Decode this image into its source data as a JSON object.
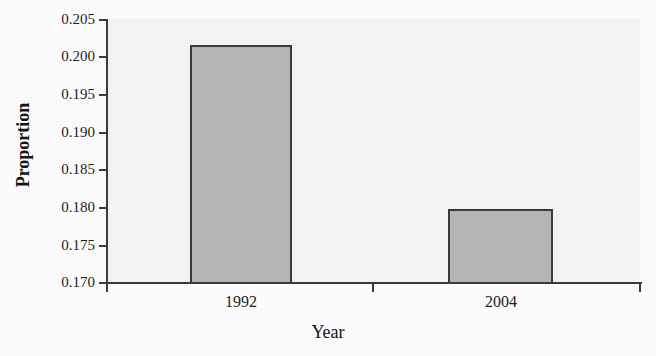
{
  "chart_data": {
    "type": "bar",
    "title": "",
    "subtitle": "",
    "xlabel": "Year",
    "ylabel": "Proportion",
    "categories": [
      "1992",
      "2004"
    ],
    "values": [
      0.202,
      0.1801
    ],
    "series": [
      {
        "name": "Proportion",
        "values": [
          0.202,
          0.1801
        ]
      }
    ],
    "ylim": [
      0.17,
      0.2055
    ],
    "xlim": [
      0,
      1
    ],
    "y_ticks": [
      0.17,
      0.175,
      0.18,
      0.185,
      0.19,
      0.195,
      0.2,
      0.205
    ],
    "y_tick_labels": [
      "0.170",
      "0.175",
      "0.180",
      "0.185",
      "0.190",
      "0.195",
      "0.200",
      "0.205"
    ],
    "x_tick_labels": [
      "1992",
      "2004"
    ],
    "grid": false,
    "legend": false,
    "legend_position": "none",
    "bar_fill_color": "#b6b6b6",
    "bar_edge_color": "#3a3a3a",
    "plot_background_color": "#f4f4f4",
    "axis_color": "#3b3b3b",
    "text_color": "#1d1d1d"
  },
  "axes": {
    "y_title": "Proportion",
    "x_title": "Year",
    "y_tick_labels": [
      {
        "value": "0.205"
      },
      {
        "value": "0.200"
      },
      {
        "value": "0.195"
      },
      {
        "value": "0.190"
      },
      {
        "value": "0.185"
      },
      {
        "value": "0.180"
      },
      {
        "value": "0.175"
      },
      {
        "value": "0.170"
      }
    ],
    "x_tick_labels": [
      {
        "value": "1992"
      },
      {
        "value": "2004"
      }
    ]
  }
}
